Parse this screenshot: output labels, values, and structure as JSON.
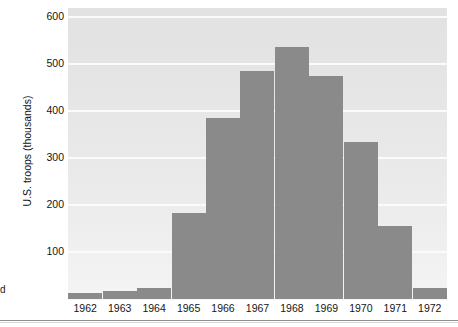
{
  "figure": {
    "edge_fragment_text": "d",
    "background_color": "#ffffff",
    "plot_background_color": "#e7e7e7",
    "gridline_color": "#fbfbfb",
    "bar_color": "#8a8a8a",
    "tick_text_color": "#151515"
  },
  "chart_data": {
    "type": "bar",
    "title": "",
    "subtitle": "",
    "xlabel": "",
    "ylabel": "U.S. troops (thousands)",
    "categories": [
      "1962",
      "1963",
      "1964",
      "1965",
      "1966",
      "1967",
      "1968",
      "1969",
      "1970",
      "1971",
      "1972"
    ],
    "values": [
      12,
      17,
      23,
      184,
      385,
      485,
      536,
      475,
      335,
      156,
      24
    ],
    "ylim": [
      0,
      620
    ],
    "yticks": [
      100,
      200,
      300,
      400,
      500,
      600
    ],
    "ytick_labels": [
      "100",
      "200",
      "300",
      "400",
      "500",
      "600"
    ],
    "xtick_labels": [
      "1962",
      "1963",
      "1964",
      "1965",
      "1966",
      "1967",
      "1968",
      "1969",
      "1970",
      "1971",
      "1972"
    ],
    "grid": true,
    "grid_axis": "y",
    "legend": false,
    "legend_position": "none",
    "annotations": []
  }
}
